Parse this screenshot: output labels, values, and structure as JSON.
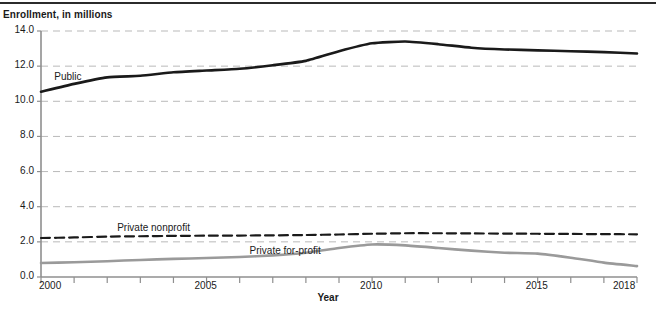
{
  "figure": {
    "y_axis_title": "Enrollment, in millions",
    "x_axis_title": "Year"
  },
  "chart_data": {
    "type": "line",
    "title": "",
    "xlabel": "Year",
    "ylabel": "Enrollment, in millions",
    "xlim": [
      2000,
      2018
    ],
    "ylim": [
      0.0,
      14.0
    ],
    "ytick_labels": [
      "0.0",
      "2.0",
      "4.0",
      "6.0",
      "8.0",
      "10.0",
      "12.0",
      "14.0"
    ],
    "ytick_values": [
      0.0,
      2.0,
      4.0,
      6.0,
      8.0,
      10.0,
      12.0,
      14.0
    ],
    "xtick_labels": [
      "2000",
      "2005",
      "2010",
      "2015",
      "2018"
    ],
    "xtick_values": [
      2000,
      2005,
      2010,
      2015,
      2018
    ],
    "x_minor_ticks": [
      2000,
      2001,
      2002,
      2003,
      2004,
      2005,
      2006,
      2007,
      2008,
      2009,
      2010,
      2011,
      2012,
      2013,
      2014,
      2015,
      2016,
      2017,
      2018
    ],
    "grid": "horizontal-dashed",
    "legend_position": "inline-labels",
    "x": [
      2000,
      2001,
      2002,
      2003,
      2004,
      2005,
      2006,
      2007,
      2008,
      2009,
      2010,
      2011,
      2012,
      2013,
      2014,
      2015,
      2016,
      2017,
      2018
    ],
    "series": [
      {
        "name": "Public",
        "label": "Public",
        "color": "#1a1a1a",
        "style": "solid",
        "width": 2.6,
        "label_x": 2000.4,
        "label_y": 11.35,
        "values": [
          10.54,
          10.99,
          11.36,
          11.45,
          11.65,
          11.75,
          11.85,
          12.05,
          12.3,
          12.85,
          13.3,
          13.4,
          13.25,
          13.05,
          12.95,
          12.9,
          12.85,
          12.8,
          12.72
        ]
      },
      {
        "name": "Private nonprofit",
        "label": "Private nonprofit",
        "color": "#1a1a1a",
        "style": "dashed",
        "width": 2.2,
        "label_x": 2002.3,
        "label_y": 2.72,
        "values": [
          2.22,
          2.25,
          2.3,
          2.32,
          2.34,
          2.35,
          2.36,
          2.37,
          2.39,
          2.42,
          2.46,
          2.49,
          2.49,
          2.48,
          2.47,
          2.46,
          2.45,
          2.44,
          2.43
        ]
      },
      {
        "name": "Private for-profit",
        "label": "Private for-profit",
        "color": "#9a9a9a",
        "style": "solid",
        "width": 2.6,
        "label_x": 2006.3,
        "label_y": 1.42,
        "values": [
          0.8,
          0.84,
          0.9,
          0.97,
          1.03,
          1.08,
          1.14,
          1.23,
          1.38,
          1.65,
          1.85,
          1.8,
          1.65,
          1.5,
          1.38,
          1.33,
          1.1,
          0.82,
          0.62
        ]
      }
    ]
  }
}
